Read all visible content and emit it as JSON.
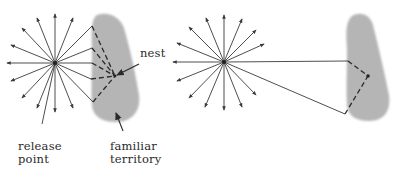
{
  "diagram": {
    "colors": {
      "background": "#ffffff",
      "ray": "#3a3a3a",
      "territory": "#b5b5b5",
      "path": "#2a2a2a",
      "text": "#2a2a2a"
    },
    "left_panel": {
      "release_point": {
        "x": 55,
        "y": 63
      },
      "labels": {
        "release_point": "release\npoint",
        "familiar_territory": "familiar\nterritory",
        "nest": "nest"
      },
      "nest_point": {
        "x": 115,
        "y": 76
      }
    },
    "right_panel": {
      "release_point": {
        "x": 224,
        "y": 62
      },
      "nest_point": {
        "x": 368,
        "y": 76
      }
    }
  }
}
